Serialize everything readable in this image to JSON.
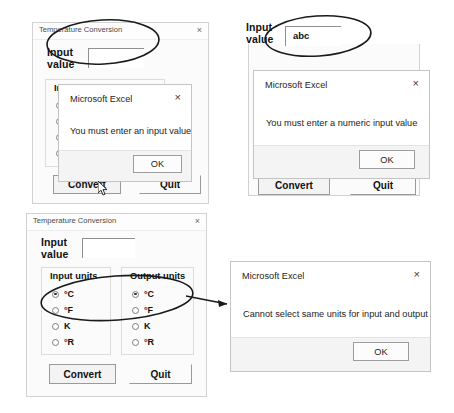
{
  "figure": {
    "background_color": "#ffffff",
    "annotation_color": "#1a1a1a"
  },
  "panels": [
    {
      "id": "panel-empty-input",
      "form": {
        "title": "Temperature Conversion",
        "close_label": "×",
        "input_label_line1": "Input",
        "input_label_line2": "value",
        "input_value": "",
        "groupbox_input_title": "Input units",
        "convert_label": "Convert",
        "quit_label": "Quit"
      },
      "dialog": {
        "title": "Microsoft Excel",
        "close_label": "×",
        "message": "You must enter an input value",
        "ok_label": "OK"
      },
      "annotation": {
        "ellipse_target": "input-value-textbox",
        "cursor": "arrow-pointer-on-convert"
      }
    },
    {
      "id": "panel-nonnumeric-input",
      "form": {
        "input_label_line1": "Input",
        "input_label_line2": "value",
        "input_value": "abc",
        "convert_label": "Convert",
        "quit_label": "Quit"
      },
      "dialog": {
        "title": "Microsoft Excel",
        "close_label": "×",
        "message": "You must enter a numeric input value",
        "ok_label": "OK"
      },
      "annotation": {
        "ellipse_target": "input-value-textbox-abc"
      }
    },
    {
      "id": "panel-same-units",
      "form": {
        "title": "Temperature Conversion",
        "close_label": "×",
        "input_label_line1": "Input",
        "input_label_line2": "value",
        "input_value": "",
        "groupbox_input_title": "Input units",
        "groupbox_output_title": "Output units",
        "convert_label": "Convert",
        "quit_label": "Quit",
        "input_units": [
          {
            "label": "°C",
            "selected": true
          },
          {
            "label": "°F",
            "selected": false
          },
          {
            "label": "K",
            "selected": false
          },
          {
            "label": "°R",
            "selected": false
          }
        ],
        "output_units": [
          {
            "label": "°C",
            "selected": true
          },
          {
            "label": "°F",
            "selected": false
          },
          {
            "label": "K",
            "selected": false
          },
          {
            "label": "°R",
            "selected": false
          }
        ]
      },
      "dialog": {
        "title": "Microsoft Excel",
        "close_label": "×",
        "message": "Cannot select same units for input and output",
        "ok_label": "OK"
      },
      "annotation": {
        "ellipse_target": "both-celsius-radio-buttons",
        "arrow_to": "same-units-message-box"
      }
    }
  ]
}
